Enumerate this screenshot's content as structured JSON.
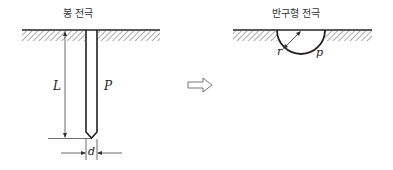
{
  "rod_electrode": {
    "title": "봉 전극",
    "length_label": "L",
    "potential_label": "P",
    "diameter_label": "d"
  },
  "transform_arrow": {
    "icon": "hollow-right-arrow"
  },
  "hemisphere_electrode": {
    "title": "반구형 전극",
    "radius_label": "r",
    "potential_label": "p"
  },
  "colors": {
    "line": "#222222",
    "hatch": "#555555",
    "background": "#ffffff"
  }
}
